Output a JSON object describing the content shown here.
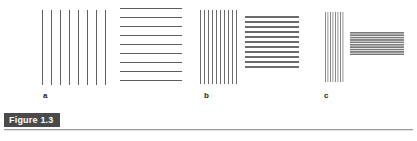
{
  "figure": {
    "badge_label": "Figure 1.3",
    "background_color": "#ffffff",
    "badge_background_color": "#4a4a4a",
    "badge_text_color": "#ffffff",
    "rule_color": "#9a9a9a",
    "bar_color": "#6e6e6e"
  },
  "panels": [
    {
      "label": "a",
      "label_x": 43,
      "label_y": 92,
      "vertical_grating": {
        "name": "panel-a-vertical-grating",
        "x": 42,
        "y": 10,
        "width": 66,
        "height": 75,
        "line_count": 8,
        "period_px": 9,
        "bar_width_px": 1,
        "orientation": "vertical"
      },
      "horizontal_grating": {
        "name": "panel-a-horizontal-grating",
        "x": 120,
        "y": 8,
        "width": 62,
        "height": 81,
        "line_count": 10,
        "period_px": 9,
        "bar_width_px": 1,
        "orientation": "horizontal"
      }
    },
    {
      "label": "b",
      "label_x": 204,
      "label_y": 92,
      "vertical_grating": {
        "name": "panel-b-vertical-grating",
        "x": 200,
        "y": 10,
        "width": 40,
        "height": 74,
        "line_count": 10,
        "period_px": 4,
        "bar_width_px": 1.4,
        "orientation": "vertical"
      },
      "horizontal_grating": {
        "name": "panel-b-horizontal-grating",
        "x": 245,
        "y": 16,
        "width": 54,
        "height": 54,
        "line_count": 11,
        "period_px": 5,
        "bar_width_px": 1.6,
        "orientation": "horizontal"
      }
    },
    {
      "label": "c",
      "label_x": 324,
      "label_y": 92,
      "vertical_grating": {
        "name": "panel-c-vertical-grating",
        "x": 325,
        "y": 12,
        "width": 20,
        "height": 70,
        "line_count": 8,
        "period_px": 2.5,
        "bar_width_px": 1.2,
        "orientation": "vertical"
      },
      "horizontal_grating": {
        "name": "panel-c-horizontal-grating",
        "x": 350,
        "y": 32,
        "width": 54,
        "height": 24,
        "line_count": 10,
        "period_px": 2.4,
        "bar_width_px": 1.2,
        "orientation": "horizontal"
      }
    }
  ]
}
